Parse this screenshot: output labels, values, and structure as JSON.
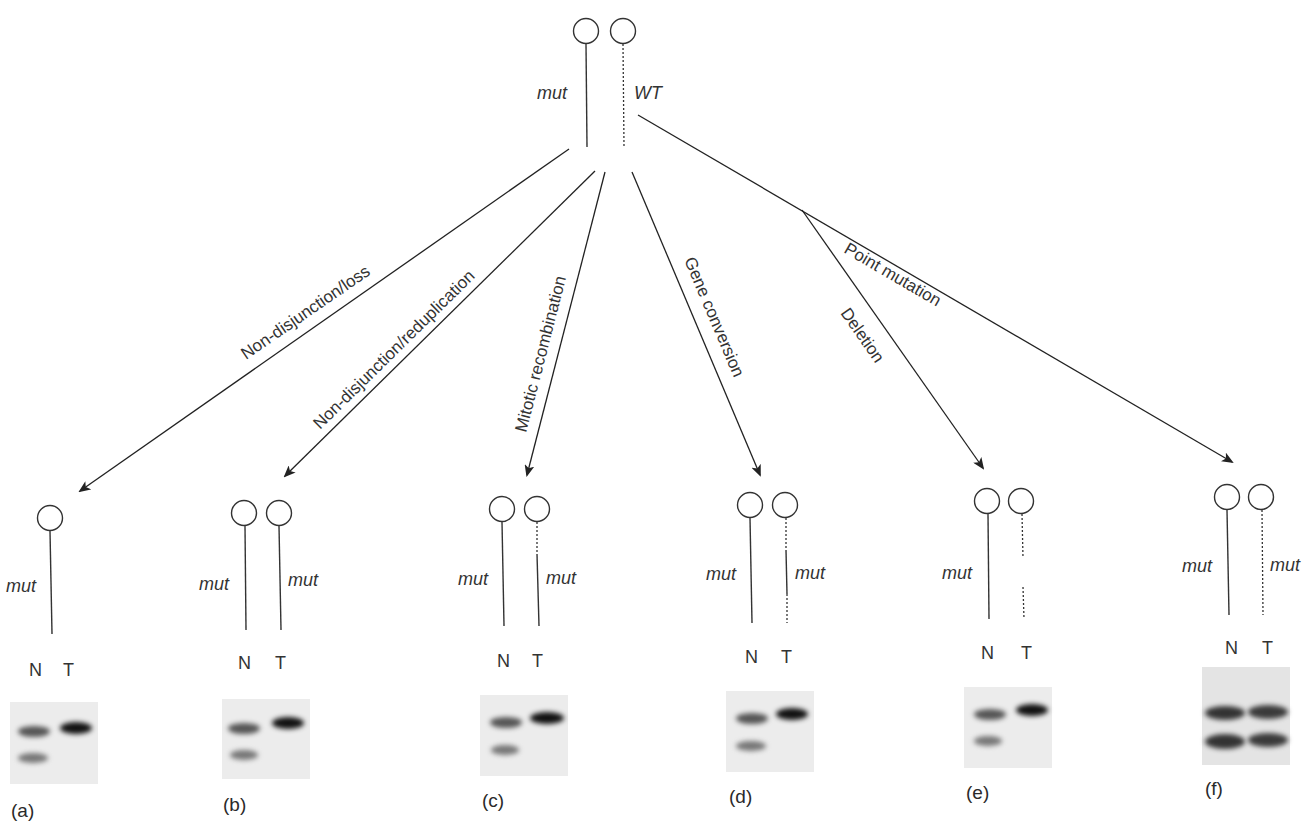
{
  "diagram": {
    "origin": {
      "chromosomes": [
        {
          "allele": "mut",
          "line": "solid"
        },
        {
          "allele": "WT",
          "line": "dotted"
        }
      ]
    },
    "mechanisms": [
      {
        "id": "a",
        "label": "Non-disjunction/loss"
      },
      {
        "id": "b",
        "label": "Non-disjunction/reduplication"
      },
      {
        "id": "c",
        "label": "Mitotic recombination"
      },
      {
        "id": "d",
        "label": "Gene conversion"
      },
      {
        "id": "e",
        "label": "Deletion"
      },
      {
        "id": "f",
        "label": "Point mutation"
      }
    ],
    "panels": [
      {
        "id": "a",
        "panel_label": "(a)",
        "left_allele": "mut",
        "right_allele": "",
        "lane_n": "N",
        "lane_t": "T",
        "gel": {
          "N": [
            "upper",
            "lower"
          ],
          "T": [
            "upper-strong"
          ]
        }
      },
      {
        "id": "b",
        "panel_label": "(b)",
        "left_allele": "mut",
        "right_allele": "mut",
        "lane_n": "N",
        "lane_t": "T",
        "gel": {
          "N": [
            "upper",
            "lower"
          ],
          "T": [
            "upper-strong"
          ]
        }
      },
      {
        "id": "c",
        "panel_label": "(c)",
        "left_allele": "mut",
        "right_allele": "mut",
        "lane_n": "N",
        "lane_t": "T",
        "gel": {
          "N": [
            "upper",
            "lower"
          ],
          "T": [
            "upper-strong"
          ]
        }
      },
      {
        "id": "d",
        "panel_label": "(d)",
        "left_allele": "mut",
        "right_allele": "mut",
        "lane_n": "N",
        "lane_t": "T",
        "gel": {
          "N": [
            "upper",
            "lower"
          ],
          "T": [
            "upper-strong"
          ]
        }
      },
      {
        "id": "e",
        "panel_label": "(e)",
        "left_allele": "mut",
        "right_allele": "",
        "lane_n": "N",
        "lane_t": "T",
        "gel": {
          "N": [
            "upper",
            "lower"
          ],
          "T": [
            "upper-strong"
          ]
        }
      },
      {
        "id": "f",
        "panel_label": "(f)",
        "left_allele": "mut",
        "right_allele": "mut",
        "lane_n": "N",
        "lane_t": "T",
        "gel": {
          "N": [
            "upper",
            "lower"
          ],
          "T": [
            "upper",
            "lower"
          ]
        }
      }
    ]
  }
}
